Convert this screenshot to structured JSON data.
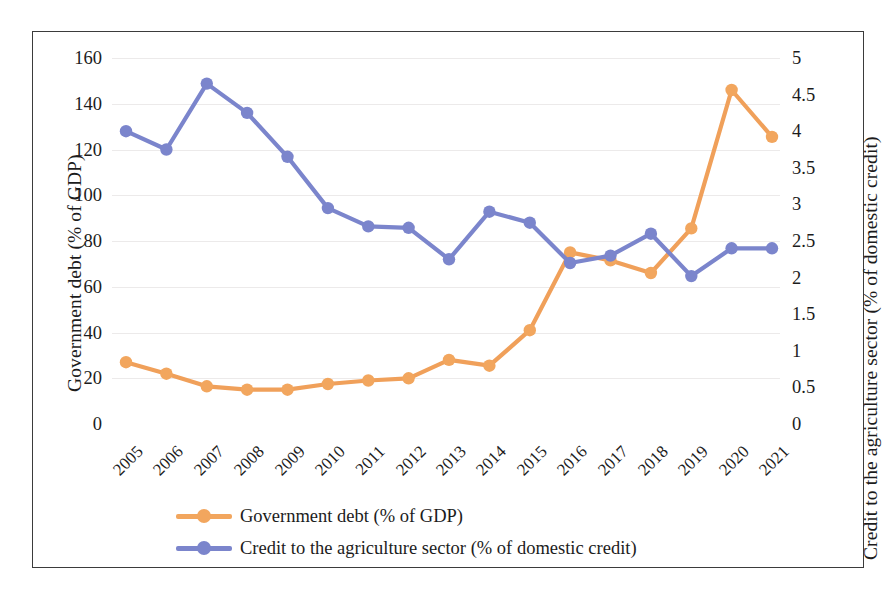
{
  "chart_data": {
    "type": "line",
    "title": "",
    "xlabel": "",
    "ylabel": "Government debt (% of GDP)",
    "y2label": "Credit to the agriculture sector (% of domestic credit)",
    "categories": [
      "2005",
      "2006",
      "2007",
      "2008",
      "2009",
      "2010",
      "2011",
      "2012",
      "2013",
      "2014",
      "2015",
      "2016",
      "2017",
      "2018",
      "2019",
      "2020",
      "2021"
    ],
    "ylim": [
      0,
      160
    ],
    "yticks": [
      "0",
      "20",
      "40",
      "60",
      "80",
      "100",
      "120",
      "140",
      "160"
    ],
    "y2lim": [
      0,
      5
    ],
    "y2ticks": [
      "0",
      "0.5",
      "1",
      "1.5",
      "2",
      "2.5",
      "3",
      "3.5",
      "4",
      "4.5",
      "5"
    ],
    "grid": true,
    "legend_position": "bottom-left",
    "series": [
      {
        "name": "Government debt (% of GDP)",
        "axis": "left",
        "color": "#F0A05A",
        "marker_color": "#F2A65E",
        "values": [
          27,
          22,
          16.5,
          15,
          15,
          17.5,
          19,
          20,
          28,
          25.5,
          41,
          75,
          71.5,
          66,
          85.5,
          146,
          125.5
        ]
      },
      {
        "name": "Credit to the agriculture sector (% of domestic credit)",
        "axis": "right",
        "color": "#7B85CC",
        "marker_color": "#7B85CC",
        "values": [
          4.0,
          3.75,
          4.65,
          4.25,
          3.65,
          2.95,
          2.7,
          2.68,
          2.25,
          2.9,
          2.75,
          2.2,
          2.3,
          2.6,
          2.02,
          2.4,
          2.4
        ]
      }
    ]
  },
  "legend": {
    "items": [
      {
        "label": "Government debt (% of GDP)",
        "color": "#F2A65E"
      },
      {
        "label": "Credit to the agriculture sector (% of domestic credit)",
        "color": "#7B85CC"
      }
    ]
  }
}
